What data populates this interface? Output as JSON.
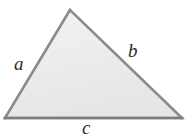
{
  "figure": {
    "type": "geometry-diagram",
    "shape": "triangle",
    "canvas": {
      "width": 194,
      "height": 136,
      "background": "#ffffff"
    },
    "style": {
      "fill_color": "#ededed",
      "fill_color_light": "#f6f6f6",
      "stroke_color": "#8a8a8a",
      "stroke_color_dark": "#6f6f6f",
      "stroke_width": 2.4,
      "label_color": "#2b2b2b"
    },
    "vertices": [
      {
        "name": "apex",
        "x": 70,
        "y": 10
      },
      {
        "name": "bottom-right",
        "x": 182,
        "y": 118
      },
      {
        "name": "bottom-left",
        "x": 5,
        "y": 118
      }
    ],
    "sides": [
      {
        "id": "a",
        "label": "a",
        "from": "bottom-left",
        "to": "apex",
        "label_x": 22,
        "label_y": 64
      },
      {
        "id": "b",
        "label": "b",
        "from": "apex",
        "to": "bottom-right",
        "label_x": 136,
        "label_y": 52
      },
      {
        "id": "c",
        "label": "c",
        "from": "bottom-left",
        "to": "bottom-right",
        "label_x": 89,
        "label_y": 128
      }
    ]
  }
}
